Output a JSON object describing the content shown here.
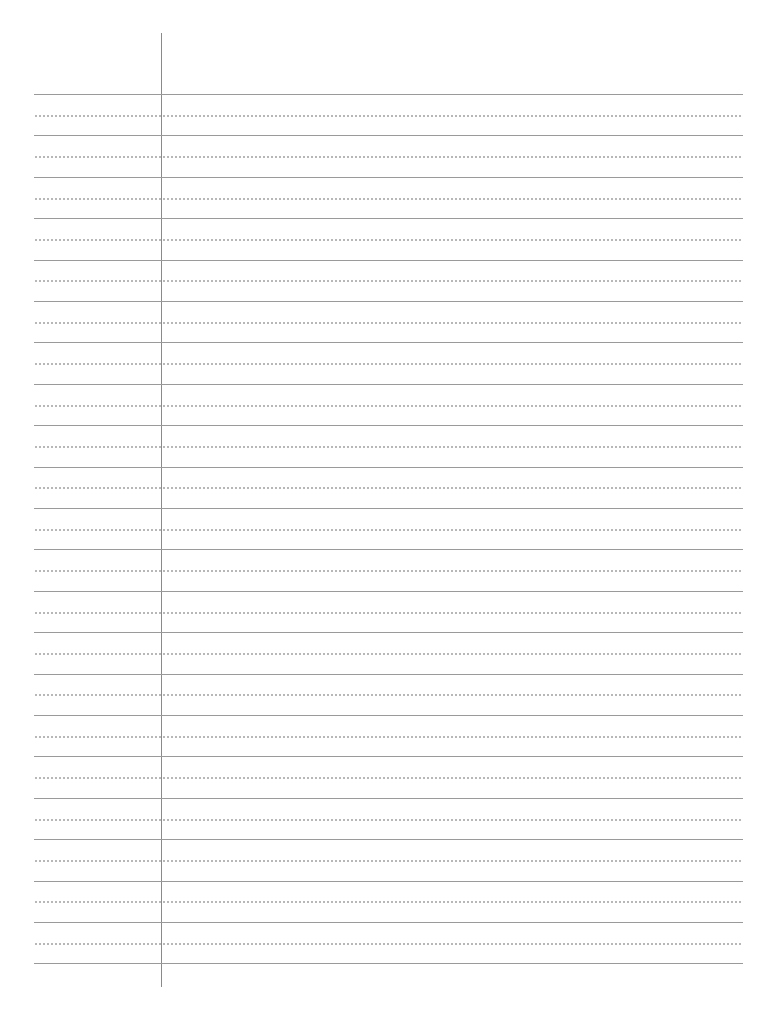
{
  "paper": {
    "type": "lined-paper",
    "background": "#ffffff",
    "solid_line_color": "#9a9a9a",
    "dotted_line_color": "#b5b5b5",
    "margin_line_color": "#8a8a8a",
    "solid_line_count": 22,
    "dotted_line_count": 21,
    "line_spacing_px": 41.4,
    "first_line_y": 94
  }
}
